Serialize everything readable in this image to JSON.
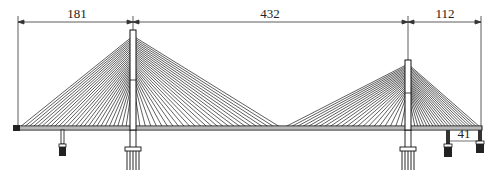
{
  "diagram": {
    "type": "cable-stayed bridge elevation",
    "colors": {
      "line": "#111111",
      "cable": "#1a1a1a",
      "background": "#ffffff"
    },
    "dimensions": {
      "side_span_left": "181",
      "main_span": "432",
      "side_span_right": "112",
      "auxiliary_span_right": "41"
    },
    "towers": [
      {
        "id": "tower-1",
        "x": 133,
        "top_y": 30
      },
      {
        "id": "tower-2",
        "x": 408,
        "top_y": 60
      }
    ],
    "deck": {
      "x_start": 14,
      "x_end": 482,
      "y": 127
    },
    "piers": [
      {
        "id": "aux-pier-left",
        "x": 62
      },
      {
        "id": "main-pier-1",
        "x": 133
      },
      {
        "id": "main-pier-2",
        "x": 408
      },
      {
        "id": "aux-pier-right",
        "x": 448
      },
      {
        "id": "end-pier-right",
        "x": 480
      }
    ]
  }
}
